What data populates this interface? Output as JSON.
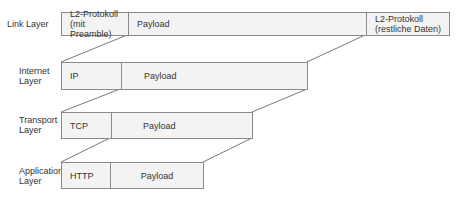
{
  "layers": [
    {
      "name": "Link Layer",
      "segments": [
        {
          "label": "L2-Protokoll\n(mit Preamble)",
          "line1": "L2-Protokoll",
          "line2": "(mit Preamble)"
        },
        {
          "label": "Payload"
        },
        {
          "label": "L2-Protokoll\n(restliche Daten)",
          "line1": "L2-Protokoll",
          "line2": "(restliche Daten)"
        }
      ]
    },
    {
      "name": "Internet Layer",
      "name_line1": "Internet",
      "name_line2": "Layer",
      "segments": [
        {
          "label": "IP"
        },
        {
          "label": "Payload"
        }
      ]
    },
    {
      "name": "Transport Layer",
      "name_line1": "Transport",
      "name_line2": "Layer",
      "segments": [
        {
          "label": "TCP"
        },
        {
          "label": "Payload"
        }
      ]
    },
    {
      "name": "Application Layer",
      "name_line1": "Application",
      "name_line2": "Layer",
      "segments": [
        {
          "label": "HTTP"
        },
        {
          "label": "Payload"
        }
      ]
    }
  ],
  "colors": {
    "box_fill": "#f3f3f3",
    "border": "#8a8a8a",
    "text": "#333333"
  }
}
